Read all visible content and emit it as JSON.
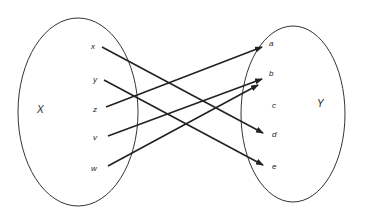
{
  "diagram": {
    "type": "function-mapping",
    "sets": [
      {
        "id": "X",
        "label": "X",
        "elements": [
          "x",
          "y",
          "z",
          "v",
          "w"
        ]
      },
      {
        "id": "Y",
        "label": "Y",
        "elements": [
          "a",
          "b",
          "c",
          "d",
          "e"
        ]
      }
    ],
    "mappings": [
      {
        "from": "x",
        "to": "d"
      },
      {
        "from": "y",
        "to": "e"
      },
      {
        "from": "z",
        "to": "a"
      },
      {
        "from": "v",
        "to": "b"
      },
      {
        "from": "w",
        "to": "b"
      }
    ],
    "labels": {
      "X": "X",
      "Y": "Y",
      "x": "x",
      "y": "y",
      "z": "z",
      "v": "v",
      "w": "w",
      "a": "a",
      "b": "b",
      "c": "c",
      "d": "d",
      "e": "e"
    },
    "colors": {
      "stroke": "#222222",
      "background": "#ffffff"
    }
  }
}
